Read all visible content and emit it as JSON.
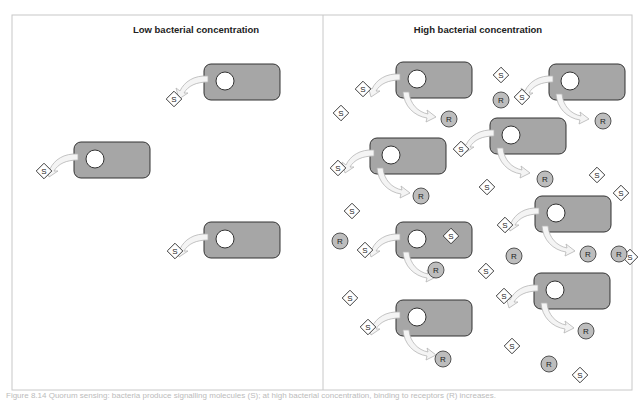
{
  "figure": {
    "panels": [
      {
        "title": "Low bacterial concentration",
        "cells": [
          {
            "x": 204,
            "y": 64
          },
          {
            "x": 74,
            "y": 142
          },
          {
            "x": 204,
            "y": 222
          }
        ],
        "signals": [
          {
            "x": 174,
            "y": 99
          },
          {
            "x": 44,
            "y": 171
          },
          {
            "x": 175,
            "y": 251
          }
        ],
        "receptors": []
      },
      {
        "title": "High bacterial concentration",
        "cells": [
          {
            "x": 396,
            "y": 62
          },
          {
            "x": 549,
            "y": 64
          },
          {
            "x": 490,
            "y": 118
          },
          {
            "x": 370,
            "y": 138
          },
          {
            "x": 535,
            "y": 196
          },
          {
            "x": 396,
            "y": 222
          },
          {
            "x": 534,
            "y": 273
          },
          {
            "x": 396,
            "y": 300
          }
        ],
        "signals": [
          {
            "x": 363,
            "y": 89
          },
          {
            "x": 341,
            "y": 113
          },
          {
            "x": 501,
            "y": 75
          },
          {
            "x": 522,
            "y": 97
          },
          {
            "x": 461,
            "y": 149
          },
          {
            "x": 338,
            "y": 168
          },
          {
            "x": 487,
            "y": 187
          },
          {
            "x": 352,
            "y": 211
          },
          {
            "x": 597,
            "y": 175
          },
          {
            "x": 505,
            "y": 225
          },
          {
            "x": 365,
            "y": 250
          },
          {
            "x": 451,
            "y": 236
          },
          {
            "x": 486,
            "y": 271
          },
          {
            "x": 630,
            "y": 257
          },
          {
            "x": 350,
            "y": 298
          },
          {
            "x": 504,
            "y": 296
          },
          {
            "x": 368,
            "y": 327
          },
          {
            "x": 512,
            "y": 346
          },
          {
            "x": 580,
            "y": 375
          },
          {
            "x": 621,
            "y": 193
          }
        ],
        "receptors": [
          {
            "x": 449,
            "y": 119
          },
          {
            "x": 501,
            "y": 100
          },
          {
            "x": 603,
            "y": 121
          },
          {
            "x": 421,
            "y": 196
          },
          {
            "x": 545,
            "y": 179
          },
          {
            "x": 340,
            "y": 241
          },
          {
            "x": 514,
            "y": 256
          },
          {
            "x": 588,
            "y": 254
          },
          {
            "x": 436,
            "y": 270
          },
          {
            "x": 586,
            "y": 331
          },
          {
            "x": 443,
            "y": 359
          },
          {
            "x": 549,
            "y": 364
          },
          {
            "x": 619,
            "y": 254
          }
        ]
      }
    ],
    "signal_label": "S",
    "receptor_label": "R",
    "colors": {
      "cell_fill": "#a6a6a6",
      "cell_stroke": "#333333",
      "receptor_fill": "#bdbdbd",
      "signal_fill": "#ffffff",
      "arrow_fill": "#f4f4f4",
      "arrow_stroke": "#b5b5b5",
      "frame": "#c8c8c8"
    },
    "caption": "Figure 8.14  Quorum sensing: bacteria produce signalling molecules (S); at high bacterial concentration, binding to receptors (R) increases."
  }
}
